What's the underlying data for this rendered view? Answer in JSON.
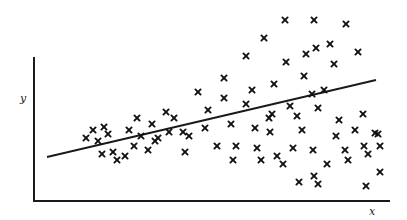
{
  "chart_data": {
    "type": "scatter",
    "title": "",
    "xlabel": "x",
    "ylabel": "y",
    "grid": false,
    "legend": null,
    "marker": "x",
    "axes": {
      "origin_px": [
        34,
        201
      ],
      "y_axis_top_px": 57,
      "x_axis_right_px": 390
    },
    "regression_line_px": {
      "x1": 47,
      "y1": 157,
      "x2": 376,
      "y2": 80
    },
    "annotations": [
      "Scatter spread widens with x (heteroscedasticity)"
    ],
    "points_px": [
      [
        86,
        138
      ],
      [
        93,
        130
      ],
      [
        98,
        141
      ],
      [
        104,
        127
      ],
      [
        108,
        134
      ],
      [
        102,
        154
      ],
      [
        113,
        152
      ],
      [
        117,
        160
      ],
      [
        125,
        156
      ],
      [
        129,
        130
      ],
      [
        134,
        146
      ],
      [
        137,
        118
      ],
      [
        141,
        136
      ],
      [
        148,
        150
      ],
      [
        152,
        124
      ],
      [
        155,
        141
      ],
      [
        158,
        138
      ],
      [
        166,
        112
      ],
      [
        169,
        132
      ],
      [
        174,
        118
      ],
      [
        183,
        132
      ],
      [
        185,
        152
      ],
      [
        189,
        136
      ],
      [
        198,
        92
      ],
      [
        205,
        128
      ],
      [
        208,
        110
      ],
      [
        217,
        146
      ],
      [
        224,
        78
      ],
      [
        224,
        98
      ],
      [
        231,
        124
      ],
      [
        236,
        146
      ],
      [
        246,
        56
      ],
      [
        246,
        104
      ],
      [
        252,
        90
      ],
      [
        255,
        128
      ],
      [
        257,
        148
      ],
      [
        261,
        160
      ],
      [
        264,
        38
      ],
      [
        270,
        132
      ],
      [
        272,
        114
      ],
      [
        274,
        84
      ],
      [
        277,
        156
      ],
      [
        283,
        164
      ],
      [
        285,
        20
      ],
      [
        286,
        62
      ],
      [
        290,
        106
      ],
      [
        293,
        148
      ],
      [
        297,
        116
      ],
      [
        302,
        130
      ],
      [
        304,
        76
      ],
      [
        306,
        54
      ],
      [
        312,
        94
      ],
      [
        314,
        20
      ],
      [
        313,
        150
      ],
      [
        314,
        176
      ],
      [
        316,
        48
      ],
      [
        318,
        108
      ],
      [
        324,
        90
      ],
      [
        327,
        164
      ],
      [
        330,
        44
      ],
      [
        334,
        64
      ],
      [
        336,
        136
      ],
      [
        339,
        120
      ],
      [
        345,
        150
      ],
      [
        346,
        24
      ],
      [
        348,
        160
      ],
      [
        355,
        130
      ],
      [
        358,
        52
      ],
      [
        363,
        114
      ],
      [
        364,
        146
      ],
      [
        366,
        186
      ],
      [
        368,
        154
      ],
      [
        375,
        133
      ],
      [
        378,
        134
      ],
      [
        380,
        146
      ],
      [
        380,
        172
      ],
      [
        299,
        182
      ],
      [
        318,
        184
      ],
      [
        233,
        160
      ],
      [
        269,
        118
      ]
    ]
  }
}
